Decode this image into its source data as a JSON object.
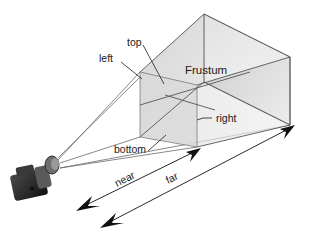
{
  "diagram": {
    "title": "Frustum",
    "labels": {
      "top": "top",
      "left": "left",
      "right": "right",
      "bottom": "bottom",
      "near": "near",
      "far": "far",
      "frustum": "Frustum"
    },
    "colors": {
      "face_light": "#ededed",
      "face_mid": "#d6d6d6",
      "face_dark": "#c4c4c4",
      "edge": "#555555",
      "text": "#1a1a1a",
      "camera": "#2b2b2b"
    },
    "icons": {
      "camera": "camera-icon"
    }
  }
}
